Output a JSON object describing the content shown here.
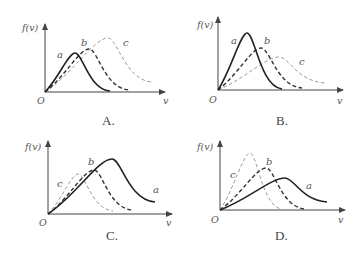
{
  "figure": {
    "y_axis_label": "f(v)",
    "x_axis_label": "v",
    "origin_label": "O"
  },
  "panels": [
    {
      "id": "A",
      "caption": "A.",
      "origin": [
        45,
        92
      ],
      "y_axis_top": 24,
      "x_axis_end": 165,
      "ylabel_pos": [
        22,
        31
      ],
      "xlabel_pos": [
        163,
        104
      ],
      "olabel_pos": [
        37,
        104
      ],
      "caption_pos": [
        102,
        125
      ],
      "curves": [
        {
          "name": "a",
          "style": "solid",
          "peak": [
            75,
            53
          ],
          "end": [
            110,
            91
          ],
          "label_pos": [
            57,
            58
          ]
        },
        {
          "name": "b",
          "style": "dashed-dark",
          "peak": [
            89,
            49
          ],
          "end": [
            129,
            90
          ],
          "label_pos": [
            81,
            46
          ]
        },
        {
          "name": "c",
          "style": "dashed-light",
          "peak": [
            108,
            38
          ],
          "end": [
            152,
            82
          ],
          "label_pos": [
            123,
            46
          ]
        }
      ]
    },
    {
      "id": "B",
      "caption": "B.",
      "origin": [
        218,
        90
      ],
      "y_axis_top": 17,
      "x_axis_end": 343,
      "ylabel_pos": [
        197,
        28
      ],
      "xlabel_pos": [
        337,
        104
      ],
      "olabel_pos": [
        209,
        103
      ],
      "caption_pos": [
        276,
        125
      ],
      "curves": [
        {
          "name": "a",
          "style": "solid",
          "peak": [
            247,
            33
          ],
          "end": [
            282,
            89
          ],
          "label_pos": [
            231,
            44
          ]
        },
        {
          "name": "b",
          "style": "dashed-dark",
          "peak": [
            261,
            48
          ],
          "end": [
            302,
            88
          ],
          "label_pos": [
            264,
            44
          ]
        },
        {
          "name": "c",
          "style": "dashed-light",
          "peak": [
            279,
            57
          ],
          "end": [
            325,
            83
          ],
          "label_pos": [
            299,
            65
          ]
        }
      ]
    },
    {
      "id": "C",
      "caption": "C.",
      "origin": [
        48,
        214
      ],
      "y_axis_top": 141,
      "x_axis_end": 172,
      "ylabel_pos": [
        25,
        150
      ],
      "xlabel_pos": [
        166,
        226
      ],
      "olabel_pos": [
        39,
        226
      ],
      "caption_pos": [
        106,
        240
      ],
      "curves": [
        {
          "name": "a",
          "style": "solid",
          "peak": [
            112,
            159
          ],
          "end": [
            155,
            202
          ],
          "label_pos": [
            153,
            193
          ]
        },
        {
          "name": "b",
          "style": "dashed-dark",
          "peak": [
            94,
            170
          ],
          "end": [
            132,
            210
          ],
          "label_pos": [
            88,
            165
          ]
        },
        {
          "name": "c",
          "style": "dashed-light",
          "peak": [
            78,
            174
          ],
          "end": [
            113,
            211
          ],
          "label_pos": [
            57,
            187
          ]
        }
      ]
    },
    {
      "id": "D",
      "caption": "D.",
      "origin": [
        220,
        210
      ],
      "y_axis_top": 141,
      "x_axis_end": 345,
      "ylabel_pos": [
        197,
        150
      ],
      "xlabel_pos": [
        338,
        223
      ],
      "olabel_pos": [
        211,
        223
      ],
      "caption_pos": [
        275,
        240
      ],
      "curves": [
        {
          "name": "a",
          "style": "solid",
          "peak": [
            285,
            178
          ],
          "end": [
            327,
            202
          ],
          "label_pos": [
            306,
            189
          ]
        },
        {
          "name": "b",
          "style": "dashed-dark",
          "peak": [
            266,
            168
          ],
          "end": [
            305,
            209
          ],
          "label_pos": [
            266,
            165
          ]
        },
        {
          "name": "c",
          "style": "dashed-light",
          "peak": [
            250,
            153
          ],
          "end": [
            282,
            209
          ],
          "label_pos": [
            230,
            178
          ]
        }
      ]
    }
  ]
}
